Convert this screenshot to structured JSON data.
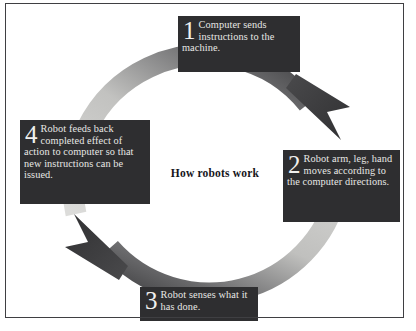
{
  "figure": {
    "title": "How robots work",
    "frame_color": "#3f3f42",
    "background": "#ffffff"
  },
  "diagram": {
    "type": "cycle",
    "direction": "clockwise",
    "ring_color_light": "#d8d8d6",
    "ring_color_dark": "#3a3a3c",
    "box_color": "#2e2e30",
    "box_text_color": "#e8e8e6",
    "steps": [
      {
        "number": "1",
        "text": "Computer sends instructions to the machine.",
        "position": "top"
      },
      {
        "number": "2",
        "text": "Robot arm, leg, hand moves according to the computer directions.",
        "position": "right"
      },
      {
        "number": "3",
        "text": "Robot senses what it has done.",
        "position": "bottom"
      },
      {
        "number": "4",
        "text": "Robot feeds back completed effect of action to computer so that new instructions can be issued.",
        "position": "left"
      }
    ],
    "arrows": [
      {
        "name": "arrow-top-right",
        "points_to": "step-2"
      },
      {
        "name": "arrow-bottom-left",
        "points_to": "step-4"
      }
    ]
  }
}
